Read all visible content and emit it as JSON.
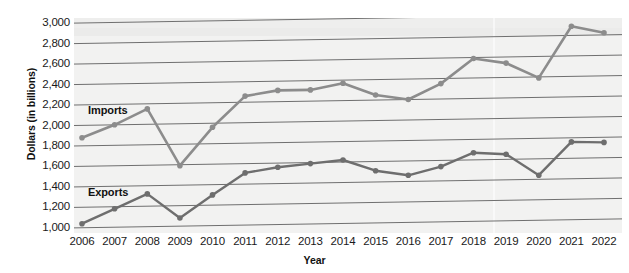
{
  "chart_data": {
    "type": "line",
    "title": "",
    "xlabel": "Year",
    "ylabel": "Dollars (in billions)",
    "categories": [
      2006,
      2007,
      2008,
      2009,
      2010,
      2011,
      2012,
      2013,
      2014,
      2015,
      2016,
      2017,
      2018,
      2019,
      2020,
      2021,
      2022
    ],
    "x_tick_labels": [
      "2006",
      "2007",
      "2008",
      "2009",
      "2010",
      "2011",
      "2012",
      "2013",
      "2014",
      "2015",
      "2016",
      "2017",
      "2018",
      "2019",
      "2020",
      "2021",
      "2022"
    ],
    "y_tick_labels": [
      "3,000",
      "2,800",
      "2,600",
      "2,400",
      "2,200",
      "2,000",
      "1,800",
      "1,600",
      "1,400",
      "1,200",
      "1,000"
    ],
    "y_tick_values": [
      3000,
      2800,
      2600,
      2400,
      2200,
      2000,
      1800,
      1600,
      1400,
      1200,
      1000
    ],
    "ylim": [
      950,
      3050
    ],
    "grid": true,
    "legend_position": "inline-annotation",
    "series": [
      {
        "name": "Imports",
        "color": "#8c8c8c",
        "values": [
          1880,
          2000,
          2150,
          1590,
          1960,
          2260,
          2310,
          2310,
          2370,
          2250,
          2200,
          2350,
          2590,
          2540,
          2390,
          2890,
          2820
        ]
      },
      {
        "name": "Exports",
        "color": "#6e6e6e",
        "values": [
          1040,
          1180,
          1320,
          1080,
          1300,
          1510,
          1560,
          1590,
          1620,
          1510,
          1460,
          1540,
          1670,
          1650,
          1440,
          1760,
          1750
        ]
      }
    ],
    "annotations": [
      {
        "text": "Imports",
        "series": "Imports"
      },
      {
        "text": "Exports",
        "series": "Exports"
      }
    ]
  },
  "style": {
    "plot_background": "#f2f2f1",
    "gridline_color": "#6f6f6f",
    "text_color": "#1a1a1a"
  }
}
